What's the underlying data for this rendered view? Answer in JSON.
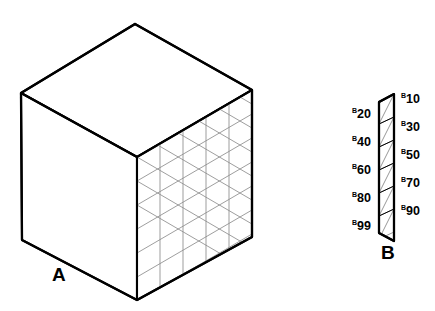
{
  "figures": {
    "a": {
      "caption": "A",
      "description": "isometric-cube-with-meshed-right-face",
      "grid_columns": 5,
      "grid_rows": 6,
      "stroke_color": "#000000",
      "mesh_color": "#8c8c8c",
      "fill_color": "#ffffff",
      "vertices": {
        "top": [
          135,
          24
        ],
        "left_top": [
          21,
          93
        ],
        "right_top": [
          252,
          90
        ],
        "center": [
          137,
          157
        ],
        "left_bottom": [
          22,
          240
        ],
        "right_bottom": [
          252,
          237
        ],
        "bottom": [
          137,
          300
        ]
      }
    },
    "b": {
      "caption": "B",
      "description": "narrow-slab-strip-with-triangular-subdivisions",
      "stroke_color": "#000000",
      "mesh_color": "#8c8c8c",
      "fill_color": "#ffffff",
      "segments": 6,
      "labels_right": [
        {
          "prefix": "B",
          "number": "10",
          "x": 401,
          "y": 98
        },
        {
          "prefix": "B",
          "number": "30",
          "x": 401,
          "y": 126
        },
        {
          "prefix": "B",
          "number": "50",
          "x": 401,
          "y": 154
        },
        {
          "prefix": "B",
          "number": "70",
          "x": 401,
          "y": 182
        },
        {
          "prefix": "B",
          "number": "90",
          "x": 401,
          "y": 210
        }
      ],
      "labels_left": [
        {
          "prefix": "B",
          "number": "20",
          "x": 352,
          "y": 113
        },
        {
          "prefix": "B",
          "number": "40",
          "x": 352,
          "y": 141
        },
        {
          "prefix": "B",
          "number": "60",
          "x": 352,
          "y": 169
        },
        {
          "prefix": "B",
          "number": "80",
          "x": 352,
          "y": 197
        },
        {
          "prefix": "B",
          "number": "99",
          "x": 352,
          "y": 225
        }
      ]
    }
  }
}
